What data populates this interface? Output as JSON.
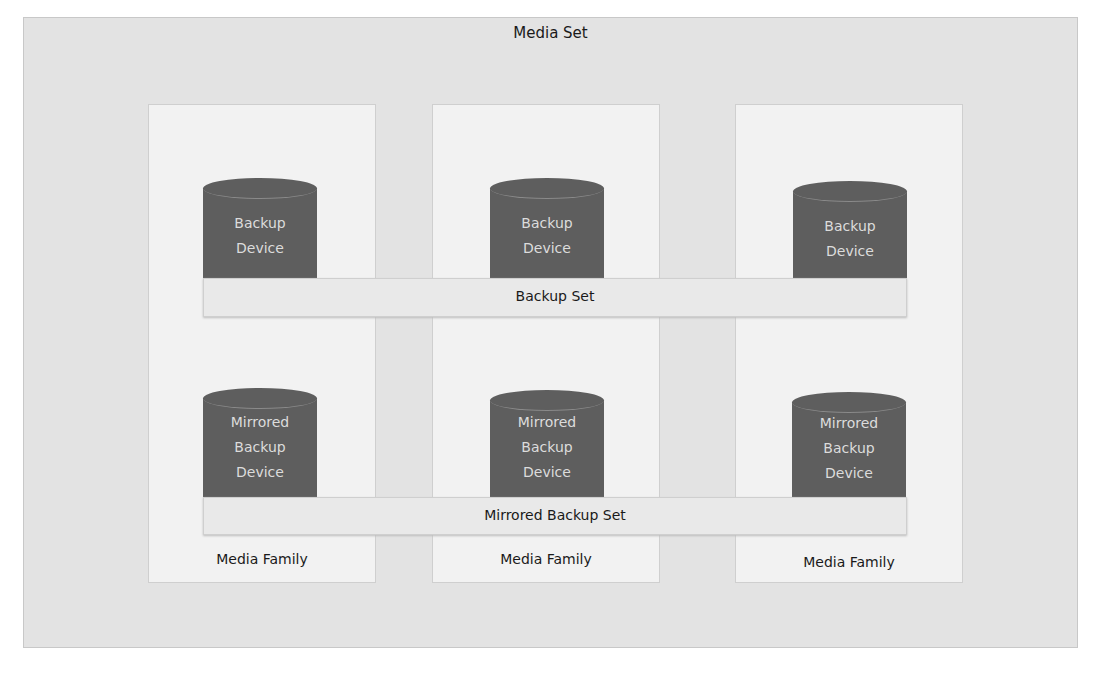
{
  "diagram": {
    "title": "Media Set",
    "families": [
      {
        "label": "Media Family",
        "device": [
          "Backup",
          "Device"
        ],
        "mirror": [
          "Mirrored",
          "Backup",
          "Device"
        ]
      },
      {
        "label": "Media Family",
        "device": [
          "Backup",
          "Device"
        ],
        "mirror": [
          "Mirrored",
          "Backup",
          "Device"
        ]
      },
      {
        "label": "Media Family",
        "device": [
          "Backup",
          "Device"
        ],
        "mirror": [
          "Mirrored",
          "Backup",
          "Device"
        ]
      }
    ],
    "backup_set": "Backup Set",
    "mirrored_backup_set": "Mirrored Backup Set",
    "colors": {
      "outer_bg": "#e3e3e3",
      "family_bg": "#f2f2f2",
      "cylinder": "#5e5e5e",
      "cylinder_text": "#dcdcdc",
      "bar_bg": "#e9e9e9"
    }
  }
}
